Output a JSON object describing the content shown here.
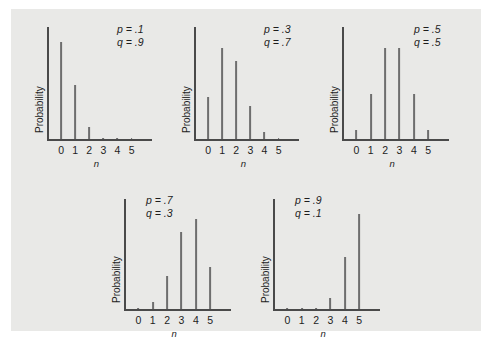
{
  "figure": {
    "background_color": "#e9e9e7",
    "bar_color": "#6e6e6e",
    "axis_color": "#4a4a4a",
    "text_color": "#1d1d1d"
  },
  "chart_data": [
    {
      "type": "bar",
      "title": "",
      "xlabel": "n",
      "ylabel": "Probability",
      "categories": [
        "0",
        "1",
        "2",
        "3",
        "4",
        "5"
      ],
      "values": [
        0.59,
        0.328,
        0.073,
        0.0081,
        0.00045,
        1e-05
      ],
      "ylim": [
        0,
        0.62
      ],
      "grid": false,
      "annotations": [
        "p = .1",
        "q = .9"
      ],
      "params": {
        "p": ".1",
        "q": ".9"
      }
    },
    {
      "type": "bar",
      "title": "",
      "xlabel": "n",
      "ylabel": "Probability",
      "categories": [
        "0",
        "1",
        "2",
        "3",
        "4",
        "5"
      ],
      "values": [
        0.168,
        0.36,
        0.309,
        0.132,
        0.028,
        0.0024
      ],
      "ylim": [
        0,
        0.4
      ],
      "grid": false,
      "annotations": [
        "p = .3",
        "q = .7"
      ],
      "params": {
        "p": ".3",
        "q": ".7"
      }
    },
    {
      "type": "bar",
      "title": "",
      "xlabel": "n",
      "ylabel": "Probability",
      "categories": [
        "0",
        "1",
        "2",
        "3",
        "4",
        "5"
      ],
      "values": [
        0.031,
        0.156,
        0.313,
        0.313,
        0.156,
        0.031
      ],
      "ylim": [
        0,
        0.35
      ],
      "grid": false,
      "annotations": [
        "p = .5",
        "q = .5"
      ],
      "params": {
        "p": ".5",
        "q": ".5"
      }
    },
    {
      "type": "bar",
      "title": "",
      "xlabel": "n",
      "ylabel": "Probability",
      "categories": [
        "0",
        "1",
        "2",
        "3",
        "4",
        "5"
      ],
      "values": [
        0.0024,
        0.028,
        0.132,
        0.309,
        0.36,
        0.168
      ],
      "ylim": [
        0,
        0.4
      ],
      "grid": false,
      "annotations": [
        "p = .7",
        "q = .3"
      ],
      "params": {
        "p": ".7",
        "q": ".3"
      }
    },
    {
      "type": "bar",
      "title": "",
      "xlabel": "n",
      "ylabel": "Probability",
      "categories": [
        "0",
        "1",
        "2",
        "3",
        "4",
        "5"
      ],
      "values": [
        1e-05,
        0.00045,
        0.0081,
        0.073,
        0.328,
        0.59
      ],
      "ylim": [
        0,
        0.62
      ],
      "grid": false,
      "annotations": [
        "p = .9",
        "q = .1"
      ],
      "params": {
        "p": ".9",
        "q": ".1"
      }
    }
  ]
}
